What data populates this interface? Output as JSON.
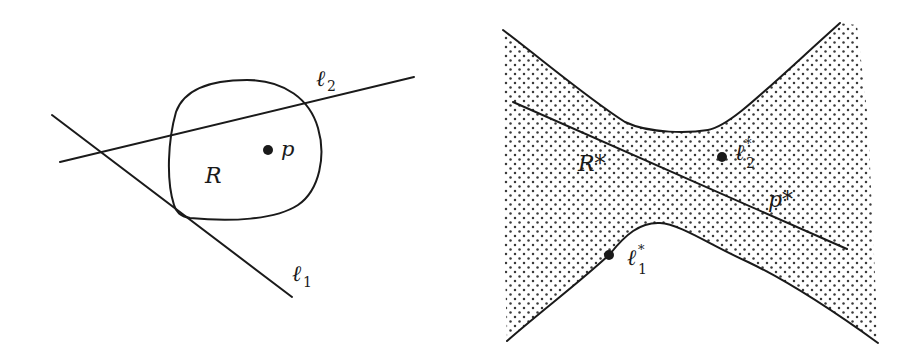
{
  "figure": {
    "left_panel": {
      "name": "primal plane",
      "region_label": "R",
      "point_label": "p",
      "line1_label": "ℓ",
      "line1_sub": "1",
      "line2_label": "ℓ",
      "line2_sub": "2"
    },
    "right_panel": {
      "name": "dual plane",
      "region_label": "R*",
      "line_label": "p*",
      "point1_label": "ℓ",
      "point1_sup": "*",
      "point1_sub": "1",
      "point2_label": "ℓ",
      "point2_sup": "*",
      "point2_sub": "2"
    },
    "colors": {
      "ink": "#1a1a1a",
      "background": "#ffffff",
      "dot_pattern": "#3a3a3a"
    }
  }
}
